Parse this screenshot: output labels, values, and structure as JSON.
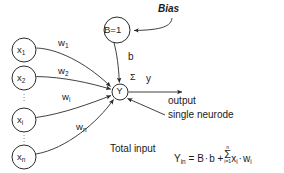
{
  "diagram": {
    "colors": {
      "stroke": "#2b2b2b",
      "text": "#1a1a1a",
      "background": "#ffffff",
      "dots": "#777777"
    },
    "input_nodes": [
      {
        "id": "x1",
        "base": "x",
        "sub": "1",
        "cx": 24,
        "cy": 50,
        "r": 12
      },
      {
        "id": "x2",
        "base": "x",
        "sub": "2",
        "cx": 24,
        "cy": 78,
        "r": 12
      },
      {
        "id": "xi",
        "base": "x",
        "sub": "i",
        "cx": 24,
        "cy": 120,
        "r": 12
      },
      {
        "id": "xn",
        "base": "x",
        "sub": "n",
        "cx": 24,
        "cy": 157,
        "r": 12
      }
    ],
    "bias_node": {
      "label": "B=1",
      "cx": 117,
      "cy": 30,
      "r": 13
    },
    "neuron_node": {
      "label": "Y",
      "cx": 120,
      "cy": 92,
      "r": 8
    },
    "weights": [
      {
        "id": "w1",
        "base": "w",
        "sub": "1",
        "x": 58,
        "y": 43
      },
      {
        "id": "w2",
        "base": "w",
        "sub": "2",
        "x": 58,
        "y": 71
      },
      {
        "id": "wi",
        "base": "w",
        "sub": "i",
        "x": 62,
        "y": 97
      },
      {
        "id": "wn",
        "base": "w",
        "sub": "n",
        "x": 76,
        "y": 127
      }
    ],
    "bias_weight_label": {
      "text": "b",
      "x": 128,
      "y": 57
    },
    "bias_annotation": {
      "text": "Bias",
      "x": 158,
      "y": 9
    },
    "summation_symbol": {
      "text": "Σ",
      "x": 131,
      "y": 78
    },
    "output_signal_label": {
      "text": "y",
      "x": 146,
      "y": 79
    },
    "output_label": {
      "text": "output",
      "x": 168,
      "y": 96
    },
    "neurode_label": {
      "text": "single neurode",
      "x": 168,
      "y": 117
    },
    "formula": {
      "caption": "Total input",
      "caption_x": 110,
      "caption_y": 146,
      "lhs_base": "Y",
      "lhs_sub": "in",
      "equals": "=",
      "term1_b": "B",
      "dot1": "·",
      "term1_w": "b",
      "plus": "+",
      "sigma": "Σ",
      "sigma_upper": "n",
      "sigma_lower": "i=1",
      "term2_x_base": "x",
      "term2_x_sub": "i",
      "dot2": "·",
      "term2_w_base": "w",
      "term2_w_sub": "i",
      "x": 172,
      "y": 146
    },
    "vertical_ellipses": [
      {
        "id": "ellipsis-upper",
        "x": 24,
        "y": 96
      },
      {
        "id": "ellipsis-lower",
        "x": 24,
        "y": 137
      }
    ]
  }
}
